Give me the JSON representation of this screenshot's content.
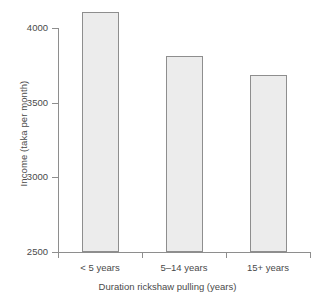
{
  "chart_data": {
    "type": "bar",
    "title": "",
    "xlabel": "Duration rickshaw pulling (years)",
    "ylabel": "Income (taka per month)",
    "categories": [
      "< 5 years",
      "5–14 years",
      "15+ years"
    ],
    "values": [
      4107,
      3812,
      3685
    ],
    "ylim": [
      2500,
      4150
    ],
    "yticks": [
      2500,
      3000,
      3500,
      4000
    ],
    "ytick_labels": [
      "2500",
      "3000",
      "3500",
      "4000"
    ],
    "grid": false,
    "legend": false,
    "bar_fill_color": "#ececec",
    "bar_border_color": "#8e8e8e",
    "axis_color": "#8e8e8e",
    "text_color": "#4a4a4a",
    "background_color": "#ffffff"
  },
  "axes": {
    "y_title": "Income (taka per month)",
    "x_title": "Duration rickshaw pulling (years)"
  }
}
